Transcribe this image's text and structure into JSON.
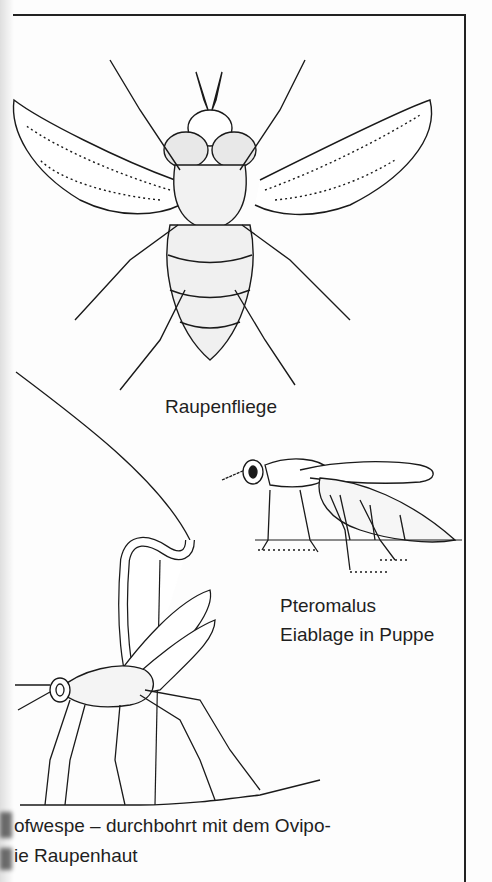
{
  "page": {
    "type": "scanned book page",
    "ink_color": "#1a1a1a",
    "paper_color": "#fdfdfd"
  },
  "illustrations": [
    {
      "id": "fly",
      "subject": "Raupenfliege (tachinid fly), dorsal view",
      "caption": "Raupenfliege"
    },
    {
      "id": "pteromalus",
      "subject": "Pteromalus wasp laying eggs in pupa",
      "caption_lines": [
        "Pteromalus",
        "Eiablage in Puppe"
      ]
    },
    {
      "id": "ichneumon",
      "subject": "Ichneumon wasp piercing caterpillar skin with ovipositor",
      "caption_lines": [
        "ofwespe – durchbohrt mit dem Ovipo-",
        "ie Raupenhaut"
      ]
    }
  ],
  "captions": {
    "fly": "Raupenfliege",
    "pteromalus_line1": "Pteromalus",
    "pteromalus_line2": "Eiablage in Puppe",
    "wasp_line1": "ofwespe – durchbohrt mit dem Ovipo-",
    "wasp_line2": "ie Raupenhaut"
  }
}
